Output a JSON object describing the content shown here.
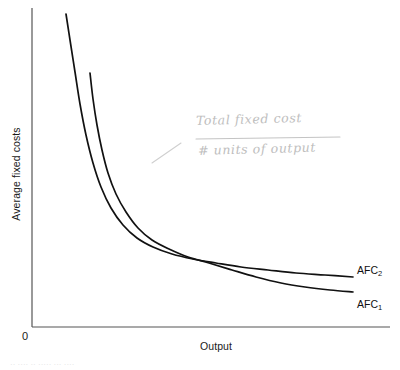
{
  "figure": {
    "origin_label": "0",
    "background_color": "#ffffff",
    "curve_color": "#111111",
    "axis_color": "#555555",
    "handwriting_color": "#b9b9b9",
    "bottom_caption_partial": "·· ···· ··  ····· ···  ····"
  },
  "chart_data": {
    "type": "line",
    "title": "",
    "xlabel": "Output",
    "ylabel": "Average fixed costs",
    "grid": false,
    "legend_position": "right-of-curve-ends",
    "xlim": [
      0,
      1
    ],
    "ylim": [
      0,
      1
    ],
    "axis_ticks": {
      "x": [],
      "y": []
    },
    "series": [
      {
        "name": "AFC_2",
        "label": "AFC",
        "subscript": "2",
        "description": "Higher average fixed cost curve (larger total fixed cost), rectangular hyperbola",
        "points": [
          [
            66,
            14
          ],
          [
            70,
            40
          ],
          [
            75,
            72
          ],
          [
            80,
            104
          ],
          [
            86,
            135
          ],
          [
            93,
            163
          ],
          [
            101,
            187
          ],
          [
            111,
            208
          ],
          [
            123,
            225
          ],
          [
            137,
            238
          ],
          [
            153,
            247
          ],
          [
            172,
            254
          ],
          [
            193,
            259
          ],
          [
            216,
            263
          ],
          [
            241,
            267
          ],
          [
            268,
            270
          ],
          [
            296,
            273
          ],
          [
            325,
            275
          ],
          [
            353,
            277
          ]
        ]
      },
      {
        "name": "AFC_1",
        "label": "AFC",
        "subscript": "1",
        "description": "Lower average fixed cost curve (smaller total fixed cost), rectangular hyperbola",
        "points": [
          [
            90,
            73
          ],
          [
            93,
            99
          ],
          [
            97,
            125
          ],
          [
            102,
            150
          ],
          [
            108,
            173
          ],
          [
            116,
            194
          ],
          [
            126,
            212
          ],
          [
            138,
            228
          ],
          [
            152,
            240
          ],
          [
            169,
            249
          ],
          [
            188,
            257
          ],
          [
            209,
            263
          ],
          [
            232,
            270
          ],
          [
            256,
            277
          ],
          [
            281,
            283
          ],
          [
            305,
            287
          ],
          [
            330,
            290
          ],
          [
            353,
            292
          ]
        ]
      }
    ],
    "annotations": [
      {
        "name": "afc-formula",
        "kind": "handwritten-fraction",
        "numerator": "Total fixed cost",
        "denominator": "# units of output",
        "leader_line": [
          [
            152,
            163
          ],
          [
            181,
            143
          ]
        ]
      }
    ]
  },
  "labels": {
    "afc2": "AFC",
    "afc2_sub": "2",
    "afc1": "AFC",
    "afc1_sub": "1"
  }
}
